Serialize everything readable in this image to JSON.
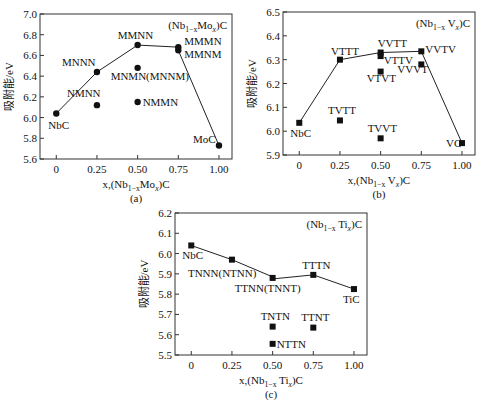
{
  "chart_data": [
    {
      "id": "a",
      "type": "scatter",
      "caption": "(a)",
      "title": "(Nb1-xMox)C",
      "title_parts": {
        "pre": "(Nb",
        "sub": "1−x",
        "mid": "Mo",
        "sub2": "x",
        "post": ")C"
      },
      "xlabel": "x,(Nb1-xMox)C",
      "xlabel_parts": {
        "pre": "x,(Nb",
        "sub": "1−x",
        "mid": "Mo",
        "sub2": "x",
        "post": ")C"
      },
      "ylabel": "吸附能/eV",
      "xlim": [
        -0.1,
        1.08
      ],
      "ylim": [
        5.6,
        7.0
      ],
      "xticks": [
        0,
        0.25,
        0.5,
        0.75,
        1.0
      ],
      "xtick_labels": [
        "0",
        "0.25",
        "0.50",
        "0.75",
        "1.00"
      ],
      "yticks": [
        5.6,
        5.8,
        6.0,
        6.2,
        6.4,
        6.6,
        6.8,
        7.0
      ],
      "ytick_labels": [
        "5.6",
        "5.8",
        "6.0",
        "6.2",
        "6.4",
        "6.6",
        "6.8",
        "7.0"
      ],
      "marker": "circle",
      "points": [
        {
          "label": "NbC",
          "x": 0.0,
          "y": 6.04,
          "lx": -8,
          "ly": 16,
          "anchor": "start"
        },
        {
          "label": "MNNN",
          "x": 0.25,
          "y": 6.44,
          "lx": -35,
          "ly": -6,
          "anchor": "start"
        },
        {
          "label": "NMNN",
          "x": 0.25,
          "y": 6.12,
          "lx": -30,
          "ly": -8,
          "anchor": "start"
        },
        {
          "label": "MMNN",
          "x": 0.5,
          "y": 6.7,
          "lx": -20,
          "ly": -6,
          "anchor": "start"
        },
        {
          "label": "MNMN(MNNM)",
          "x": 0.5,
          "y": 6.48,
          "lx": -27,
          "ly": 12,
          "anchor": "start"
        },
        {
          "label": "NMMN",
          "x": 0.5,
          "y": 6.15,
          "lx": 5,
          "ly": 4,
          "anchor": "start"
        },
        {
          "label": "MMMN",
          "x": 0.75,
          "y": 6.68,
          "lx": 6,
          "ly": -2,
          "anchor": "start"
        },
        {
          "label": "MMNM",
          "x": 0.75,
          "y": 6.65,
          "lx": 6,
          "ly": 8,
          "anchor": "start"
        },
        {
          "label": "MoC",
          "x": 1.0,
          "y": 5.73,
          "lx": -26,
          "ly": -3,
          "anchor": "start"
        }
      ],
      "line": [
        [
          0.0,
          6.04
        ],
        [
          0.25,
          6.44
        ],
        [
          0.5,
          6.7
        ],
        [
          0.75,
          6.68
        ],
        [
          0.75,
          6.65
        ],
        [
          1.0,
          5.73
        ]
      ],
      "box": {
        "left": 40,
        "top": 14,
        "width": 192,
        "height": 145
      }
    },
    {
      "id": "b",
      "type": "scatter",
      "caption": "(b)",
      "title": "(Nb1-xVx)C",
      "title_parts": {
        "pre": "(Nb",
        "sub": "1−x",
        "mid": " V",
        "sub2": "x",
        "post": ")C"
      },
      "xlabel": "x,(Nb1-xVx)C",
      "xlabel_parts": {
        "pre": "x,(Nb",
        "sub": "1−x",
        "mid": " V",
        "sub2": "x",
        "post": ")C"
      },
      "ylabel": "吸附能/eV",
      "xlim": [
        -0.1,
        1.08
      ],
      "ylim": [
        5.9,
        6.5
      ],
      "xticks": [
        0,
        0.25,
        0.5,
        0.75,
        1.0
      ],
      "xtick_labels": [
        "0",
        "0.25",
        "0.50",
        "0.75",
        "1.00"
      ],
      "yticks": [
        5.9,
        6.0,
        6.1,
        6.2,
        6.3,
        6.4,
        6.5
      ],
      "ytick_labels": [
        "5.9",
        "6.0",
        "6.1",
        "6.2",
        "6.3",
        "6.4",
        "6.5"
      ],
      "marker": "square",
      "points": [
        {
          "label": "NbC",
          "x": 0.0,
          "y": 6.035,
          "lx": -9,
          "ly": 14,
          "anchor": "start"
        },
        {
          "label": "VTTT",
          "x": 0.25,
          "y": 6.3,
          "lx": -9,
          "ly": -5,
          "anchor": "start"
        },
        {
          "label": "TVTT",
          "x": 0.25,
          "y": 6.045,
          "lx": -12,
          "ly": -6,
          "anchor": "start"
        },
        {
          "label": "VVTT",
          "x": 0.5,
          "y": 6.33,
          "lx": -3,
          "ly": -6,
          "anchor": "start"
        },
        {
          "label": "VTTV",
          "x": 0.5,
          "y": 6.315,
          "lx": 3,
          "ly": 8,
          "anchor": "start"
        },
        {
          "label": "VTVT",
          "x": 0.5,
          "y": 6.25,
          "lx": -14,
          "ly": 10,
          "anchor": "start"
        },
        {
          "label": "TVVT",
          "x": 0.5,
          "y": 5.97,
          "lx": -13,
          "ly": -6,
          "anchor": "start"
        },
        {
          "label": "VVTV",
          "x": 0.75,
          "y": 6.335,
          "lx": 4,
          "ly": 2,
          "anchor": "start"
        },
        {
          "label": "VVVT",
          "x": 0.75,
          "y": 6.28,
          "lx": -24,
          "ly": 9,
          "anchor": "start"
        },
        {
          "label": "VC",
          "x": 1.0,
          "y": 5.95,
          "lx": -16,
          "ly": 4,
          "anchor": "start"
        }
      ],
      "line": [
        [
          0.0,
          6.035
        ],
        [
          0.25,
          6.3
        ],
        [
          0.5,
          6.33
        ],
        [
          0.75,
          6.335
        ],
        [
          1.0,
          5.95
        ]
      ],
      "box": {
        "left": 283,
        "top": 12,
        "width": 192,
        "height": 143
      }
    },
    {
      "id": "c",
      "type": "scatter",
      "caption": "(c)",
      "title": "(Nb1-xTix)C",
      "title_parts": {
        "pre": "(Nb",
        "sub": "1−x",
        "mid": " Ti",
        "sub2": "x",
        "post": ")C"
      },
      "xlabel": "x,(Nb1-xTix)C",
      "xlabel_parts": {
        "pre": "x,(Nb",
        "sub": "1−x",
        "mid": " Ti",
        "sub2": "x",
        "post": ")C"
      },
      "ylabel": "吸附能/eV",
      "xlim": [
        -0.1,
        1.08
      ],
      "ylim": [
        5.5,
        6.2
      ],
      "xticks": [
        0,
        0.25,
        0.5,
        0.75,
        1.0
      ],
      "xtick_labels": [
        "0",
        "0.25",
        "0.50",
        "0.75",
        "1.00"
      ],
      "yticks": [
        5.5,
        5.6,
        5.7,
        5.8,
        5.9,
        6.0,
        6.1,
        6.2
      ],
      "ytick_labels": [
        "5.5",
        "5.6",
        "5.7",
        "5.8",
        "5.9",
        "6.0",
        "6.1",
        "6.2"
      ],
      "marker": "square",
      "points": [
        {
          "label": "NbC",
          "x": 0.0,
          "y": 6.04,
          "lx": -9,
          "ly": 14,
          "anchor": "start"
        },
        {
          "label": "TNNN(NTNN)",
          "x": 0.25,
          "y": 5.97,
          "lx": -44,
          "ly": 17,
          "anchor": "start"
        },
        {
          "label": "TTNN(TNNT)",
          "x": 0.5,
          "y": 5.88,
          "lx": -38,
          "ly": 14,
          "anchor": "start"
        },
        {
          "label": "TTTN",
          "x": 0.75,
          "y": 5.895,
          "lx": -11,
          "ly": -6,
          "anchor": "start"
        },
        {
          "label": "TiC",
          "x": 1.0,
          "y": 5.825,
          "lx": -11,
          "ly": 14,
          "anchor": "start"
        },
        {
          "label": "TNTN",
          "x": 0.5,
          "y": 5.64,
          "lx": -12,
          "ly": -7,
          "anchor": "start"
        },
        {
          "label": "TTNT",
          "x": 0.75,
          "y": 5.635,
          "lx": -12,
          "ly": -7,
          "anchor": "start"
        },
        {
          "label": "NTTN",
          "x": 0.5,
          "y": 5.555,
          "lx": 4,
          "ly": 4,
          "anchor": "start"
        }
      ],
      "line": [
        [
          0.0,
          6.04
        ],
        [
          0.25,
          5.97
        ],
        [
          0.5,
          5.885
        ],
        [
          0.5,
          5.875
        ],
        [
          0.75,
          5.895
        ],
        [
          1.0,
          5.825
        ]
      ],
      "box": {
        "left": 175,
        "top": 213,
        "width": 192,
        "height": 142
      }
    }
  ]
}
